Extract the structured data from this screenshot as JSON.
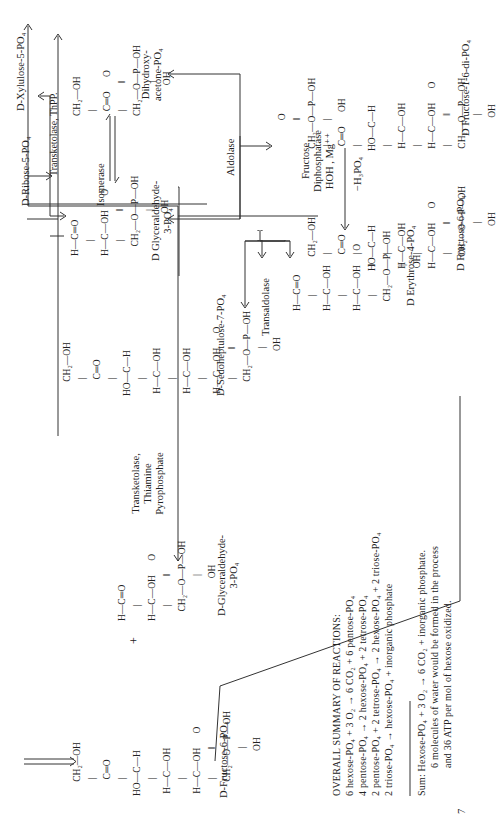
{
  "molecules": {
    "fructose6p_left": {
      "label": "D-Fructose-6-PO₄",
      "structure": "      CH₂—OH\n       |\n       C═O\n       |\nHO—C—H\n       |\n H—C—OH\n       |\n H—C—OH      O\n       |            ‖\n      CH₂—O—P—OH\n                    |\n                   OH"
    },
    "gap_left": {
      "label": "D-Glyceraldehyde-\n3-PO₄",
      "structure": "H—C═O\n      |\nH—C—OH      O\n      |            ‖\n    CH₂—O—P—OH\n                   |\n                  OH"
    },
    "sedoheptulose7p": {
      "label": "D-Sedoheptulose-7-PO₄",
      "structure": "      CH₂—OH\n       |\n       C═O\n       |\nHO—C—H\n       |\n H—C—OH\n       |\n H—C—OH\n       |\n H—C—OH      O\n       |            ‖\n      CH₂—O—P—OH\n                    |\n                   OH"
    },
    "gap_center": {
      "label": "D Glyceraldehyde-\n3-PO₄",
      "structure": "H—C═O\n      |\nH—C—OH      O\n      |            ‖\n    CH₂—O—P—OH\n                   |\n                  OH"
    },
    "dhap": {
      "label": "Dihydroxy-\nacetone-PO₄",
      "structure": "CH₂—OH\n  |\n  C═O      O\n  |           ‖\nCH₂—O—P—OH\n              |\n             OH"
    },
    "erythrose4p": {
      "label": "D Erythrose-4-PO₄",
      "structure": "H—C═O\n      |\nH—C—OH\n      |\nH—C—OH      O\n      |            ‖\n    CH₂—O—P—OH\n                   |\n                  OH"
    },
    "fructose6p_right": {
      "label": "D Fructose-6-PO₄",
      "structure": "      CH₂—OH\n       |\n       C═O\n       |\nHO—C—H\n       |\n H—C—OH\n       |\n H—C—OH      O\n       |            ‖\n      CH₂—O—P—OH\n                    |\n                   OH"
    },
    "fructose16dip": {
      "label": "D Fructose-1-6-di-PO₄",
      "structure": "             O\n             ‖\n CH₂—O—P—OH\n  |          |\n  C═O      OH\n  |\nHO—C—H\n  |\n H—C—OH\n  |\n H—C—OH      O\n  |            ‖\n CH₂—O—P—OH\n               |\n              OH"
    }
  },
  "labels": {
    "xylulose5p": "D-Xylulose-5-PO₄",
    "ribose5p": "D-Ribose-5-PO₄",
    "plus": "+"
  },
  "enzymes": {
    "transketolase_tpp": [
      "Transketolase,",
      "Thiamine",
      "Pyrophosphate"
    ],
    "transketolase_thpp": "Transketolase,  ThPP.",
    "isomerase": "Isomerase",
    "aldolase": "Aldolase",
    "transaldolase": "Transaldolase",
    "fdpase": [
      "Fructose",
      "Diphosphatase",
      "HOH , Mg⁺⁺"
    ],
    "minus_h3po4": "−H₃PO₄"
  },
  "summary": {
    "title": "OVERALL SUMMARY OF REACTIONS:",
    "lines": [
      "6 hexose-PO₄ + 3 O₂ → 6 CO₂ + 6 pentose-PO₄",
      "4 pentose-PO₄ → 2 hexose-PO₄ + 2 tetrose-PO₄",
      "2 pentose-PO₄ + 2 tetrose-PO₄ → 2 hexose-PO₄ + 2 triose-PO₄",
      "2 triose-PO₄ → hexose-PO₄ + inorganic phosphate"
    ],
    "sum": [
      "Sum:  Hexose-PO₄ + 3 O₂ → 6 CO₂ + inorganic phosphate.",
      "6 molecules of water would be formed in the process",
      "and 36 ATP per mol of hexose oxidized."
    ]
  },
  "page_number": "7"
}
